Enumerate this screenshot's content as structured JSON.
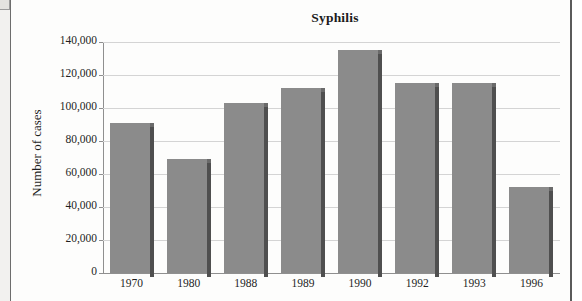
{
  "chart_data": {
    "type": "bar",
    "title": "Syphilis",
    "xlabel": "",
    "ylabel": "Number of cases",
    "categories": [
      "1970",
      "1980",
      "1988",
      "1989",
      "1990",
      "1992",
      "1993",
      "1996"
    ],
    "values": [
      91000,
      69000,
      103000,
      112000,
      135000,
      115000,
      115000,
      52000
    ],
    "ylim": [
      0,
      140000
    ],
    "ytick_step": 20000,
    "ytick_labels": [
      "0",
      "20,000",
      "40,000",
      "60,000",
      "80,000",
      "100,000",
      "120,000",
      "140,000"
    ],
    "ytick_values": [
      0,
      20000,
      40000,
      60000,
      80000,
      100000,
      120000,
      140000
    ],
    "grid": true,
    "legend": false,
    "bar_color": "#8b8b8b",
    "bar_shadow_color": "#4f4f4f",
    "gridline_color": "#d4d4d4",
    "axis_color": "#8f8f8f",
    "text_color": "#1f1f1f",
    "background_color": "#fdfdfc"
  }
}
